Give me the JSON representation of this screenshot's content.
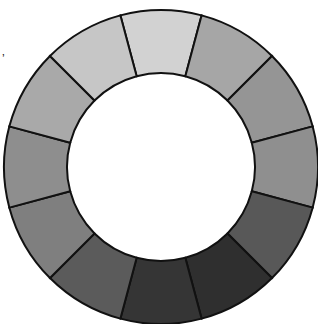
{
  "diagram": {
    "type": "segmented-ring",
    "center": [
      161,
      167
    ],
    "inner_radius": 94,
    "outer_radius": 157,
    "segment_count": 12,
    "start_angle_deg": -15,
    "stroke": "#111111",
    "stroke_width": 2,
    "segments": [
      {
        "name": "segment-1",
        "color": "#d2d2d2"
      },
      {
        "name": "segment-2",
        "color": "#a6a6a6"
      },
      {
        "name": "segment-3",
        "color": "#959595"
      },
      {
        "name": "segment-4",
        "color": "#8f8f8f"
      },
      {
        "name": "segment-5",
        "color": "#585858"
      },
      {
        "name": "segment-6",
        "color": "#2f2f2f"
      },
      {
        "name": "segment-7",
        "color": "#353535"
      },
      {
        "name": "segment-8",
        "color": "#5b5b5b"
      },
      {
        "name": "segment-9",
        "color": "#7f7f7f"
      },
      {
        "name": "segment-10",
        "color": "#8e8e8e"
      },
      {
        "name": "segment-11",
        "color": "#a9a9a9"
      },
      {
        "name": "segment-12",
        "color": "#c6c6c6"
      }
    ]
  },
  "mark": "’"
}
